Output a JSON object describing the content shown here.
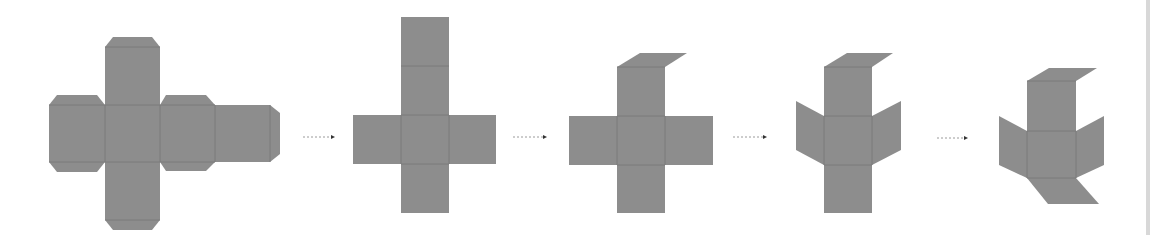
{
  "diagram": {
    "colors": {
      "face": "#8d8d8d",
      "fold_line": "#7b7b7b",
      "arrow": "#333333",
      "background": "#ffffff"
    },
    "steps": [
      {
        "index": 1,
        "label": "Flat net with glue tabs"
      },
      {
        "index": 2,
        "label": "Flat cross net (tabs removed)"
      },
      {
        "index": 3,
        "label": "Top face folded back"
      },
      {
        "index": 4,
        "label": "Side faces folded"
      },
      {
        "index": 5,
        "label": "Bottom face folded"
      }
    ],
    "arrows": [
      {
        "from": 1,
        "to": 2
      },
      {
        "from": 2,
        "to": 3
      },
      {
        "from": 3,
        "to": 4
      },
      {
        "from": 4,
        "to": 5
      }
    ]
  }
}
